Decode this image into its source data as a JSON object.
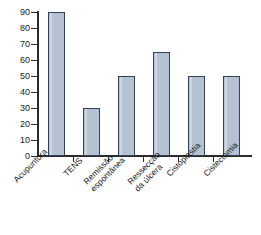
{
  "chart_data": {
    "type": "bar",
    "title": "",
    "subtitle": "",
    "xlabel": "",
    "ylabel": "",
    "categories": [
      "Acupuntura",
      "TENS",
      "Remissão\nespontânea",
      "Ressecção\nda úlcera",
      "Cistoplastia",
      "Cistectomia"
    ],
    "values": [
      90,
      30,
      50,
      65,
      50,
      50
    ],
    "ylim": [
      0,
      90
    ],
    "ytick_labels": [
      "90",
      "80",
      "70",
      "60",
      "50",
      "40",
      "30",
      "20",
      "10",
      "0"
    ],
    "ytick_values": [
      90,
      80,
      70,
      60,
      50,
      40,
      30,
      20,
      10,
      0
    ],
    "grid": false,
    "legend": false,
    "bar_fill_color": "#b4c2d2",
    "bar_border_color": "#33415c",
    "axis_color": "#2b2b2b",
    "background_color": "#ffffff",
    "xtick_label_rotation": -45
  }
}
